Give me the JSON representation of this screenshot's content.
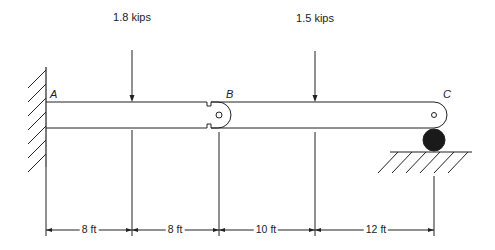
{
  "diagram": {
    "type": "beam",
    "points": {
      "A": "A",
      "B": "B",
      "C": "C"
    },
    "loads": [
      {
        "label": "1.8 kips",
        "x_ft": 8
      },
      {
        "label": "1.5 kips",
        "x_ft": 26
      }
    ],
    "dimensions": [
      {
        "label": "8 ft",
        "length_ft": 8
      },
      {
        "label": "8 ft",
        "length_ft": 8
      },
      {
        "label": "10 ft",
        "length_ft": 10
      },
      {
        "label": "12 ft",
        "length_ft": 12
      }
    ],
    "supports": {
      "A": "fixed-wall",
      "B": "internal-hinge",
      "C": "roller"
    },
    "colors": {
      "line": "#222222",
      "roller": "#1a1a1a"
    }
  }
}
